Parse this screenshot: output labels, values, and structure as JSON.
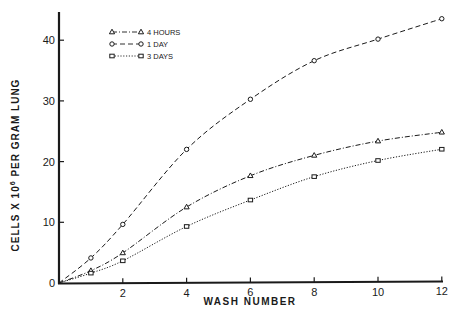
{
  "chart_data": {
    "type": "line",
    "title": "",
    "xlabel": "WASH NUMBER",
    "ylabel": "CELLS X 10^6 PER GRAM LUNG",
    "ylabel_parts": {
      "prefix": "CELLS X 10",
      "sup": "6",
      "suffix": " PER GRAM LUNG"
    },
    "xlim": [
      0,
      12
    ],
    "ylim": [
      0,
      45
    ],
    "xticks": [
      2,
      4,
      6,
      8,
      10,
      12
    ],
    "xtick_labels": [
      "2",
      "4",
      "6",
      "8",
      "10",
      "12"
    ],
    "yticks": [
      0,
      10,
      20,
      30,
      40
    ],
    "ytick_labels": [
      "0",
      "10",
      "20",
      "30",
      "40"
    ],
    "origin_label": "0",
    "grid": false,
    "legend_position": "upper-left",
    "x": [
      0,
      1,
      2,
      4,
      6,
      8,
      10,
      12
    ],
    "series": [
      {
        "name": "4 HOURS",
        "marker": "triangle",
        "line_style": "dash-dot",
        "values": [
          0,
          2.0,
          4.9,
          12.4,
          17.5,
          20.8,
          23.1,
          24.5
        ]
      },
      {
        "name": "1 DAY",
        "marker": "circle",
        "line_style": "dashed",
        "values": [
          0,
          4.1,
          9.6,
          21.9,
          30.1,
          36.4,
          39.9,
          43.2
        ]
      },
      {
        "name": "3 DAYS",
        "marker": "square",
        "line_style": "dotted",
        "values": [
          0,
          1.6,
          3.6,
          9.2,
          13.5,
          17.3,
          19.9,
          21.7
        ]
      }
    ]
  },
  "legend": {
    "items": [
      {
        "label": "4 HOURS"
      },
      {
        "label": "1 DAY"
      },
      {
        "label": "3 DAYS"
      }
    ]
  },
  "axes": {
    "x_title": "WASH NUMBER",
    "y_title_prefix": "CELLS X 10",
    "y_title_sup": "6",
    "y_title_suffix": " PER GRAM LUNG",
    "origin": "0"
  },
  "colors": {
    "ink": "#1a1a1a",
    "background": "#ffffff"
  }
}
